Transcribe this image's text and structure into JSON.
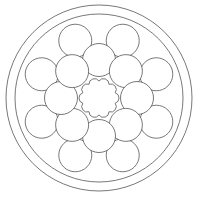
{
  "image": {
    "subject": "mandala coloring page",
    "width": 200,
    "height": 197,
    "background": "#ffffff",
    "stroke": "#555555"
  },
  "mandala": {
    "center": [
      99,
      98
    ],
    "outer_ring_radius": 93,
    "inner_ring_radius": 84,
    "inner_circles": {
      "count": 8,
      "distance": 38,
      "radius": 16.5,
      "start_angle_deg": -90
    },
    "outer_circles": {
      "count": 8,
      "distance": 62,
      "radius": 16.5,
      "start_angle_deg": -112.5
    },
    "flower": {
      "petals": 10,
      "radius": 17,
      "petal_radius": 5.5
    }
  }
}
